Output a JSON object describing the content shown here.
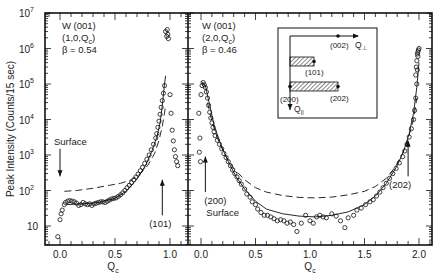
{
  "chart_data": [
    {
      "type": "scatter",
      "panel": "left",
      "annotation": {
        "line1": "W (001)",
        "line2": "(1,0,Q",
        "line2_sub": "c",
        "line2_end": ")",
        "line3": "β = 0.54"
      },
      "xlabel": "Q",
      "xlabel_sub": "c",
      "ylabel": "Peak Intensity (Counts/15 sec)",
      "yscale": "log",
      "ylim": [
        3,
        10000000
      ],
      "xlim": [
        -0.14,
        1.16
      ],
      "xticks": [
        0.0,
        0.5,
        1.0
      ],
      "xtick_labels": [
        "0.0",
        "0.5",
        "1.0"
      ],
      "yticks": [
        10,
        100,
        1000,
        10000,
        100000,
        1000000,
        10000000
      ],
      "ytick_labels": [
        {
          "base": "10",
          "exp": ""
        },
        {
          "base": "10",
          "exp": "2"
        },
        {
          "base": "10",
          "exp": "3"
        },
        {
          "base": "10",
          "exp": "4"
        },
        {
          "base": "10",
          "exp": "5"
        },
        {
          "base": "10",
          "exp": "6"
        },
        {
          "base": "10",
          "exp": "7"
        }
      ],
      "arrows": [
        {
          "label": "Surface",
          "direction": "down",
          "q": 0.0,
          "from": 1500,
          "to": 250
        },
        {
          "label": "(101)",
          "direction": "up",
          "q": 0.93,
          "from": 20,
          "to": 200
        }
      ],
      "series": [
        {
          "name": "data",
          "style": "open-circles",
          "points": [
            [
              -0.02,
              5
            ],
            [
              0.0,
              15
            ],
            [
              0.01,
              22
            ],
            [
              0.02,
              28
            ],
            [
              0.04,
              40
            ],
            [
              0.05,
              46
            ],
            [
              0.07,
              50
            ],
            [
              0.09,
              52
            ],
            [
              0.11,
              50
            ],
            [
              0.13,
              48
            ],
            [
              0.15,
              44
            ],
            [
              0.17,
              38
            ],
            [
              0.19,
              40
            ],
            [
              0.21,
              46
            ],
            [
              0.23,
              42
            ],
            [
              0.25,
              40
            ],
            [
              0.27,
              42
            ],
            [
              0.29,
              38
            ],
            [
              0.31,
              42
            ],
            [
              0.33,
              44
            ],
            [
              0.35,
              46
            ],
            [
              0.37,
              48
            ],
            [
              0.39,
              48
            ],
            [
              0.41,
              46
            ],
            [
              0.43,
              50
            ],
            [
              0.45,
              54
            ],
            [
              0.47,
              58
            ],
            [
              0.49,
              60
            ],
            [
              0.51,
              62
            ],
            [
              0.53,
              68
            ],
            [
              0.55,
              76
            ],
            [
              0.57,
              86
            ],
            [
              0.59,
              100
            ],
            [
              0.61,
              120
            ],
            [
              0.63,
              140
            ],
            [
              0.65,
              165
            ],
            [
              0.67,
              200
            ],
            [
              0.69,
              240
            ],
            [
              0.71,
              290
            ],
            [
              0.73,
              360
            ],
            [
              0.75,
              450
            ],
            [
              0.77,
              580
            ],
            [
              0.79,
              760
            ],
            [
              0.81,
              1000
            ],
            [
              0.83,
              1400
            ],
            [
              0.85,
              2000
            ],
            [
              0.87,
              3000
            ],
            [
              0.88,
              4000
            ],
            [
              0.89,
              6000
            ],
            [
              0.9,
              9000
            ],
            [
              0.91,
              14000
            ],
            [
              0.92,
              22000
            ],
            [
              0.93,
              34000
            ],
            [
              0.94,
              55000
            ],
            [
              0.95,
              90000
            ],
            [
              0.96,
              3000000
            ],
            [
              0.97,
              2200000
            ],
            [
              0.98,
              2500000
            ],
            [
              0.975,
              3400000
            ],
            [
              0.985,
              1900000
            ],
            [
              1.0,
              50000
            ],
            [
              1.01,
              15000
            ],
            [
              1.02,
              5000
            ],
            [
              1.03,
              2500
            ],
            [
              1.04,
              1400
            ],
            [
              1.05,
              900
            ],
            [
              1.06,
              650
            ],
            [
              1.07,
              500
            ]
          ]
        },
        {
          "name": "fit-solid",
          "style": "solid",
          "points": [
            [
              0.06,
              40
            ],
            [
              0.2,
              42
            ],
            [
              0.35,
              46
            ],
            [
              0.5,
              60
            ],
            [
              0.6,
              95
            ],
            [
              0.7,
              210
            ],
            [
              0.78,
              520
            ],
            [
              0.84,
              1400
            ],
            [
              0.88,
              3200
            ],
            [
              0.91,
              8000
            ],
            [
              0.93,
              25000
            ],
            [
              0.95,
              100000
            ],
            [
              0.96,
              170000
            ]
          ]
        },
        {
          "name": "fit-dashed",
          "style": "dashed",
          "points": [
            [
              0.04,
              95
            ],
            [
              0.15,
              100
            ],
            [
              0.3,
              115
            ],
            [
              0.45,
              140
            ],
            [
              0.55,
              160
            ],
            [
              0.65,
              200
            ],
            [
              0.73,
              300
            ],
            [
              0.8,
              520
            ],
            [
              0.86,
              1100
            ],
            [
              0.9,
              2600
            ],
            [
              0.93,
              6500
            ],
            [
              0.95,
              15000
            ],
            [
              0.96,
              25000
            ]
          ]
        }
      ]
    },
    {
      "type": "scatter",
      "panel": "right",
      "annotation": {
        "line1": "W (001)",
        "line2": "(2,0,Q",
        "line2_sub": "c",
        "line2_end": ")",
        "line3": "β = 0.46"
      },
      "xlabel": "Q",
      "xlabel_sub": "c",
      "yscale": "log",
      "ylim": [
        3,
        10000000
      ],
      "xlim": [
        -0.12,
        2.12
      ],
      "xticks": [
        0.0,
        0.5,
        1.0,
        1.5,
        2.0
      ],
      "xtick_labels": [
        "0.0",
        "0.5",
        "1.0",
        "1.5",
        "2.0"
      ],
      "arrows": [
        {
          "label": "(200)",
          "label2": "Surface",
          "direction": "up",
          "q": 0.04,
          "from": 90,
          "to": 900
        },
        {
          "label": "(202)",
          "direction": "up",
          "q": 1.9,
          "from": 250,
          "to": 2500
        }
      ],
      "inset": {
        "points": [
          "(002)",
          "(101)",
          "(200)",
          "(202)"
        ],
        "axis_perp": "Q",
        "axis_perp_sub": "⊥",
        "axis_par": "Q",
        "axis_par_sub": "||"
      },
      "series": [
        {
          "name": "data",
          "style": "open-circles",
          "points": [
            [
              -0.02,
              15000
            ],
            [
              -0.01,
              3000
            ],
            [
              -0.015,
              1200
            ],
            [
              -0.005,
              650
            ],
            [
              0.0,
              50000
            ],
            [
              0.01,
              90000
            ],
            [
              0.02,
              110000
            ],
            [
              0.03,
              95000
            ],
            [
              0.04,
              80000
            ],
            [
              0.05,
              60000
            ],
            [
              0.06,
              40000
            ],
            [
              0.07,
              25000
            ],
            [
              0.08,
              16000
            ],
            [
              0.09,
              11000
            ],
            [
              0.1,
              8000
            ],
            [
              0.11,
              6000
            ],
            [
              0.12,
              4500
            ],
            [
              0.13,
              3500
            ],
            [
              0.15,
              2600
            ],
            [
              0.17,
              2000
            ],
            [
              0.19,
              1500
            ],
            [
              0.21,
              1100
            ],
            [
              0.23,
              850
            ],
            [
              0.25,
              650
            ],
            [
              0.27,
              500
            ],
            [
              0.29,
              380
            ],
            [
              0.31,
              300
            ],
            [
              0.33,
              240
            ],
            [
              0.35,
              190
            ],
            [
              0.37,
              150
            ],
            [
              0.4,
              110
            ],
            [
              0.42,
              80
            ],
            [
              0.45,
              65
            ],
            [
              0.47,
              48
            ],
            [
              0.5,
              40
            ],
            [
              0.52,
              30
            ],
            [
              0.55,
              24
            ],
            [
              0.58,
              20
            ],
            [
              0.61,
              20
            ],
            [
              0.64,
              18
            ],
            [
              0.67,
              16
            ],
            [
              0.7,
              14
            ],
            [
              0.73,
              15
            ],
            [
              0.76,
              14
            ],
            [
              0.79,
              12
            ],
            [
              0.82,
              13
            ],
            [
              0.85,
              11
            ],
            [
              0.88,
              7
            ],
            [
              0.92,
              12
            ],
            [
              0.96,
              20
            ],
            [
              1.0,
              14
            ],
            [
              1.03,
              12
            ],
            [
              1.06,
              18
            ],
            [
              1.09,
              20
            ],
            [
              1.12,
              18
            ],
            [
              1.15,
              17
            ],
            [
              1.2,
              22
            ],
            [
              1.24,
              19
            ],
            [
              1.28,
              14
            ],
            [
              1.32,
              9
            ],
            [
              1.35,
              17
            ],
            [
              1.4,
              20
            ],
            [
              1.43,
              28
            ],
            [
              1.47,
              32
            ],
            [
              1.51,
              40
            ],
            [
              1.55,
              48
            ],
            [
              1.58,
              55
            ],
            [
              1.61,
              70
            ],
            [
              1.64,
              90
            ],
            [
              1.67,
              120
            ],
            [
              1.7,
              160
            ],
            [
              1.73,
              220
            ],
            [
              1.76,
              300
            ],
            [
              1.79,
              420
            ],
            [
              1.82,
              600
            ],
            [
              1.85,
              900
            ],
            [
              1.87,
              1300
            ],
            [
              1.89,
              2000
            ],
            [
              1.91,
              3200
            ],
            [
              1.93,
              5500
            ],
            [
              1.95,
              10000
            ],
            [
              1.96,
              18000
            ],
            [
              1.97,
              40000
            ],
            [
              1.98,
              100000
            ],
            [
              1.985,
              250000
            ],
            [
              1.99,
              600000
            ],
            [
              1.995,
              900000
            ],
            [
              2.0,
              1000000
            ],
            [
              1.99,
              800000
            ],
            [
              1.985,
              700000
            ],
            [
              1.98,
              450000
            ],
            [
              1.975,
              300000
            ],
            [
              1.97,
              180000
            ]
          ]
        },
        {
          "name": "fit-solid",
          "style": "solid",
          "points": [
            [
              0.0,
              120000
            ],
            [
              0.04,
              90000
            ],
            [
              0.08,
              25000
            ],
            [
              0.12,
              7000
            ],
            [
              0.18,
              2000
            ],
            [
              0.25,
              650
            ],
            [
              0.32,
              250
            ],
            [
              0.4,
              110
            ],
            [
              0.5,
              50
            ],
            [
              0.6,
              30
            ],
            [
              0.75,
              22
            ],
            [
              0.9,
              19
            ],
            [
              1.05,
              18
            ],
            [
              1.2,
              20
            ],
            [
              1.35,
              25
            ],
            [
              1.5,
              40
            ],
            [
              1.6,
              70
            ],
            [
              1.7,
              160
            ],
            [
              1.8,
              500
            ],
            [
              1.86,
              1300
            ],
            [
              1.91,
              4000
            ],
            [
              1.95,
              15000
            ],
            [
              1.98,
              80000
            ],
            [
              2.0,
              400000
            ]
          ]
        },
        {
          "name": "fit-dashed",
          "style": "dashed",
          "points": [
            [
              0.06,
              30000
            ],
            [
              0.1,
              9000
            ],
            [
              0.15,
              3000
            ],
            [
              0.22,
              1000
            ],
            [
              0.3,
              420
            ],
            [
              0.4,
              200
            ],
            [
              0.5,
              120
            ],
            [
              0.6,
              90
            ],
            [
              0.75,
              72
            ],
            [
              0.9,
              64
            ],
            [
              1.05,
              62
            ],
            [
              1.2,
              65
            ],
            [
              1.35,
              75
            ],
            [
              1.5,
              95
            ],
            [
              1.6,
              130
            ],
            [
              1.7,
              220
            ],
            [
              1.78,
              450
            ],
            [
              1.85,
              1100
            ],
            [
              1.9,
              2800
            ],
            [
              1.95,
              10000
            ],
            [
              1.98,
              40000
            ]
          ]
        }
      ]
    }
  ]
}
